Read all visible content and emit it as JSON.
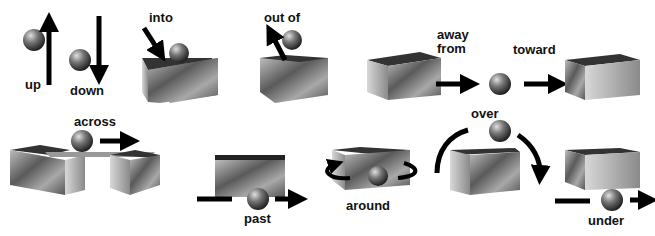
{
  "labels": {
    "up": "up",
    "down": "down",
    "into": "into",
    "out_of": "out of",
    "away_from_1": "away",
    "away_from_2": "from",
    "toward": "toward",
    "across": "across",
    "past": "past",
    "around": "around",
    "over": "over",
    "under": "under"
  },
  "colors": {
    "ball": "#6a6a6a",
    "box_light": "#c8c8c8",
    "box_dark": "#4a4a4a",
    "arrow": "#000000"
  }
}
